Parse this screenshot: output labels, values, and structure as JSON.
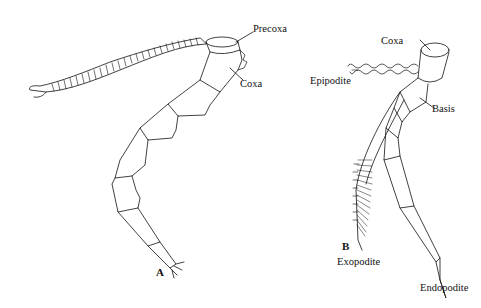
{
  "figure": {
    "panel_a": {
      "letter": "A",
      "labels": {
        "precoxa": "Precoxa",
        "coxa": "Coxa"
      }
    },
    "panel_b": {
      "letter": "B",
      "labels": {
        "coxa": "Coxa",
        "epipodite": "Epipodite",
        "basis": "Basis",
        "exopodite": "Exopodite",
        "endopodite": "Endopodite"
      }
    },
    "colors": {
      "ink": "#111111",
      "background": "#ffffff"
    }
  }
}
